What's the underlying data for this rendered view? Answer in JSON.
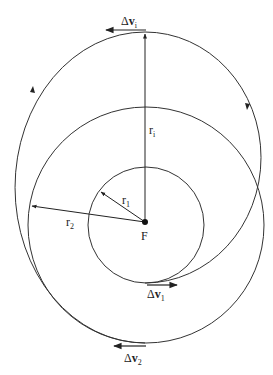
{
  "diagram": {
    "focus": {
      "label": "F",
      "x": 145,
      "y": 222
    },
    "colors": {
      "line": "#333333",
      "background": "#ffffff"
    },
    "orbits": [
      {
        "name": "inner-circular-orbit",
        "radius_label": "r",
        "radius_sub": "1",
        "r": 57
      },
      {
        "name": "outer-circular-orbit",
        "radius_label": "r",
        "radius_sub": "2",
        "r": 117
      },
      {
        "name": "transfer-ellipse-1",
        "from": "r1",
        "to": "ri"
      },
      {
        "name": "transfer-ellipse-2",
        "from": "ri",
        "to": "r2"
      }
    ],
    "radii": {
      "r1": {
        "label": "r",
        "sub": "1"
      },
      "r2": {
        "label": "r",
        "sub": "2"
      },
      "ri": {
        "label": "r",
        "sub": "i"
      }
    },
    "burns": {
      "dv1": {
        "delta": "Δ",
        "v": "v",
        "sub": "1"
      },
      "dvi": {
        "delta": "Δ",
        "v": "v",
        "sub": "i"
      },
      "dv2": {
        "delta": "Δ",
        "v": "v",
        "sub": "2"
      }
    }
  }
}
